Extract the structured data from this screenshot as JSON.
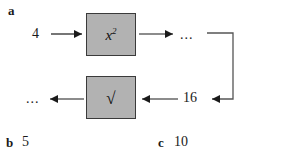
{
  "figure": {
    "background_color": "#ffffff",
    "box_fill_color": "#b2b2b2",
    "box_border_color": "#3a3a3a",
    "ink_color": "#1a1a1a"
  },
  "parts": {
    "a": {
      "letter": "a"
    },
    "b": {
      "letter": "b",
      "value": "5"
    },
    "c": {
      "letter": "c",
      "value": "10"
    }
  },
  "diagram": {
    "input_value": "4",
    "square_box_label": "x",
    "square_box_exponent": "2",
    "top_output_dots": "...",
    "feedback_value": "16",
    "sqrt_box_label": "√",
    "bottom_output_dots": "..."
  }
}
